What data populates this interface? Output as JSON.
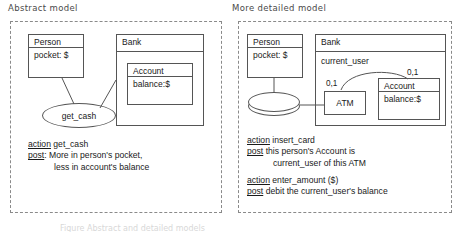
{
  "panels": [
    {
      "id": "abstract",
      "title": "Abstract model",
      "classes": [
        {
          "name": "Person",
          "attr": "pocket: $"
        },
        {
          "name": "Bank",
          "attr": ""
        },
        {
          "name": "Account",
          "attr": "balance:$"
        }
      ],
      "usecase": "get_cash",
      "specs": [
        {
          "action_kw": "action",
          "action_text": " get_cash",
          "post_kw": "post",
          "post_text": ": More in person's pocket,",
          "post_cont": "less in account's balance"
        }
      ]
    },
    {
      "id": "detailed",
      "title": "More detailed model",
      "classes": [
        {
          "name": "Person",
          "attr": "pocket: $"
        },
        {
          "name": "Bank",
          "attr": ""
        },
        {
          "name": "ATM",
          "attr": ""
        },
        {
          "name": "Account",
          "attr": "balance:$"
        }
      ],
      "association": {
        "label": "current_user",
        "mult_left": "0,1",
        "mult_right": "0,1"
      },
      "specs": [
        {
          "action_kw": "action",
          "action_text": " insert_card",
          "post_kw": "post",
          "post_text": " this person's Account is",
          "post_cont": "current_user of this ATM"
        },
        {
          "action_kw": "action",
          "action_text": " enter_amount ($)",
          "post_kw": "post",
          "post_text": " debit the current_user's balance",
          "post_cont": ""
        }
      ]
    }
  ],
  "caption": "Figure  Abstract and detailed models"
}
